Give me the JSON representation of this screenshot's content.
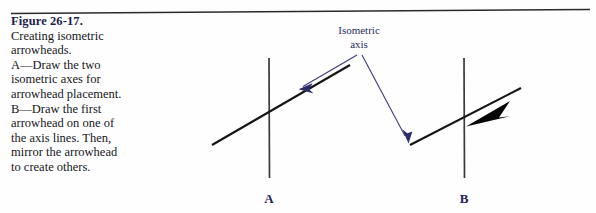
{
  "figure": {
    "label": "Figure 26-17.",
    "caption": "Creating isometric\narrowheads.\nA—Draw the two\nisometric axes for\narrowhead placement.\nB—Draw the first\narrowhead on one of\nthe axis lines. Then,\nmirror the arrowhead\nto create others."
  },
  "diagram": {
    "callout": {
      "line1": "Isometric",
      "line2": "axis"
    },
    "labels": {
      "a": "A",
      "b": "B"
    }
  },
  "colors": {
    "figure_label": "#1c1d4a",
    "caption_text": "#15161b",
    "callout_text": "#2b2c5e",
    "panel_label": "#22235c",
    "leader_line": "#3b3b7a",
    "construction_line": "#1a1a1a",
    "arrowhead_fill": "#050505",
    "rule": "#2a2a2a",
    "background": "#fefefe"
  }
}
